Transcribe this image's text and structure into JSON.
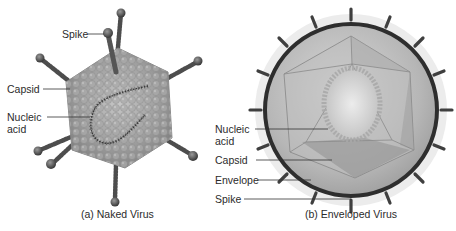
{
  "figure": {
    "panels": [
      {
        "id": "naked",
        "caption": "(a) Naked Virus",
        "labels": {
          "spike": "Spike",
          "capsid": "Capsid",
          "nucleic_line1": "Nucleic",
          "nucleic_line2": "acid"
        }
      },
      {
        "id": "enveloped",
        "caption": "(b) Enveloped Virus",
        "labels": {
          "nucleic_line1": "Nucleic",
          "nucleic_line2": "acid",
          "capsid": "Capsid",
          "envelope": "Envelope",
          "spike": "Spike"
        }
      }
    ],
    "colors": {
      "background": "#ffffff",
      "capsid_gray": "#9a9a9a",
      "spike_dark": "#4a4a4a",
      "envelope_ring": "#2e2e2e",
      "halo": "#e4e4e4",
      "leader_line": "#333333"
    }
  }
}
